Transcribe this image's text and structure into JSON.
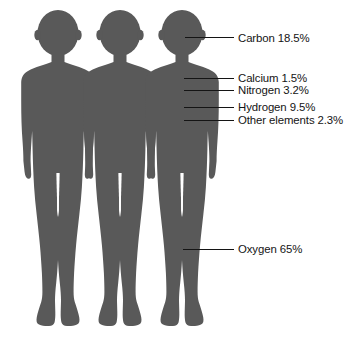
{
  "figure": {
    "type": "pictogram-infographic",
    "figure_count": 3,
    "background_color": "#ffffff"
  },
  "chart_data": {
    "type": "bar",
    "xlabel": "",
    "ylabel": "Percentage of body mass",
    "categories": [
      "Oxygen",
      "Carbon",
      "Hydrogen",
      "Nitrogen",
      "Calcium",
      "Other elements"
    ],
    "values": [
      65,
      18.5,
      9.5,
      3.2,
      1.5,
      2.3
    ],
    "ylim": [
      0,
      100
    ],
    "grid": false,
    "legend_position": "right"
  },
  "elements": [
    {
      "id": "carbon",
      "name": "Carbon",
      "percent": "18.5%",
      "label": "Carbon 18.5%",
      "color": "#2b2b2b",
      "label_x": 238,
      "label_y": 32,
      "leader_x1": 185,
      "leader_y1": 37,
      "leader_x2": 234,
      "leader_y2": 37
    },
    {
      "id": "calcium",
      "name": "Calcium",
      "percent": "1.5%",
      "label": "Calcium 1.5%",
      "color": "#cdcdcd",
      "label_x": 238,
      "label_y": 72,
      "leader_x1": 184,
      "leader_y1": 78,
      "leader_x2": 234,
      "leader_y2": 78
    },
    {
      "id": "nitrogen",
      "name": "Nitrogen",
      "percent": "3.2%",
      "label": "Nitrogen 3.2%",
      "color": "#a8a8a8",
      "label_x": 238,
      "label_y": 84,
      "leader_x1": 184,
      "leader_y1": 90,
      "leader_x2": 234,
      "leader_y2": 90
    },
    {
      "id": "hydrogen",
      "name": "Hydrogen",
      "percent": "9.5%",
      "label": "Hydrogen 9.5%",
      "color": "#949494",
      "label_x": 238,
      "label_y": 101,
      "leader_x1": 184,
      "leader_y1": 107,
      "leader_x2": 234,
      "leader_y2": 107
    },
    {
      "id": "other-elements",
      "name": "Other elements",
      "percent": "2.3%",
      "label": "Other elements 2.3%",
      "color": "#ababab",
      "label_x": 238,
      "label_y": 114,
      "leader_x1": 184,
      "leader_y1": 120,
      "leader_x2": 234,
      "leader_y2": 120
    },
    {
      "id": "oxygen",
      "name": "Oxygen",
      "percent": "65%",
      "label": "Oxygen 65%",
      "color": "#595959",
      "label_x": 238,
      "label_y": 243,
      "leader_x1": 183,
      "leader_y1": 249,
      "leader_x2": 234,
      "leader_y2": 249
    }
  ],
  "bands": {
    "carbon_top": 0,
    "calcium_top": 74.5,
    "nitrogen_top": 82.5,
    "hydrogen_top": 95.0,
    "other_top": 116.0,
    "oxygen_top": 124.0,
    "oxygen_bottom": 341
  },
  "leader_line": {
    "color": "#141414",
    "width": 1
  }
}
